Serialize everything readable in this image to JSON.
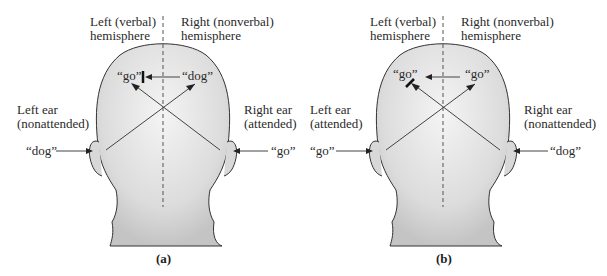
{
  "figure": {
    "panels": [
      {
        "id": "a",
        "caption": "(a)",
        "left_hemisphere_label_1": "Left (verbal)",
        "left_hemisphere_label_2": "hemisphere",
        "right_hemisphere_label_1": "Right (nonverbal)",
        "right_hemisphere_label_2": "hemisphere",
        "left_ear_label_1": "Left ear",
        "left_ear_label_2": "(nonattended)",
        "right_ear_label_1": "Right ear",
        "right_ear_label_2": "(attended)",
        "left_ear_input": "“dog”",
        "right_ear_input": "“go”",
        "left_hemisphere_word": "“go”",
        "right_hemisphere_word": "“dog”"
      },
      {
        "id": "b",
        "caption": "(b)",
        "left_hemisphere_label_1": "Left (verbal)",
        "left_hemisphere_label_2": "hemisphere",
        "right_hemisphere_label_1": "Right (nonverbal)",
        "right_hemisphere_label_2": "hemisphere",
        "left_ear_label_1": "Left ear",
        "left_ear_label_2": "(attended)",
        "right_ear_label_1": "Right ear",
        "right_ear_label_2": "(nonattended)",
        "left_ear_input": "“go”",
        "right_ear_input": "“dog”",
        "left_hemisphere_word": "“go”",
        "right_hemisphere_word": "“go”"
      }
    ]
  }
}
